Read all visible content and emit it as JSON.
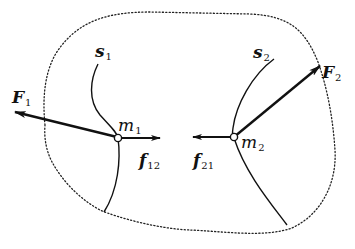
{
  "diagram": {
    "type": "physics-free-body",
    "system_boundary": "dotted",
    "colors": {
      "ink": "#111111",
      "background": "#ffffff"
    },
    "particles": [
      {
        "id": "m1",
        "symbol": "m",
        "subscript": "1",
        "path": {
          "symbol": "s",
          "subscript": "1"
        }
      },
      {
        "id": "m2",
        "symbol": "m",
        "subscript": "2",
        "path": {
          "symbol": "s",
          "subscript": "2"
        }
      }
    ],
    "forces": {
      "external": [
        {
          "id": "F1",
          "symbol": "F",
          "subscript": "1",
          "acts_on": "m1"
        },
        {
          "id": "F2",
          "symbol": "F",
          "subscript": "2",
          "acts_on": "m2"
        }
      ],
      "internal": [
        {
          "id": "f12",
          "symbol": "f",
          "subscript": "12",
          "acts_on": "m1"
        },
        {
          "id": "f21",
          "symbol": "f",
          "subscript": "21",
          "acts_on": "m2"
        }
      ]
    }
  },
  "labels": {
    "F1": {
      "main": "F",
      "sub": "1"
    },
    "F2": {
      "main": "F",
      "sub": "2"
    },
    "s1": {
      "main": "s",
      "sub": "1"
    },
    "s2": {
      "main": "s",
      "sub": "2"
    },
    "m1": {
      "main": "m",
      "sub": "1"
    },
    "m2": {
      "main": "m",
      "sub": "2"
    },
    "f12": {
      "main": "f",
      "sub": "12"
    },
    "f21": {
      "main": "f",
      "sub": "21"
    }
  }
}
